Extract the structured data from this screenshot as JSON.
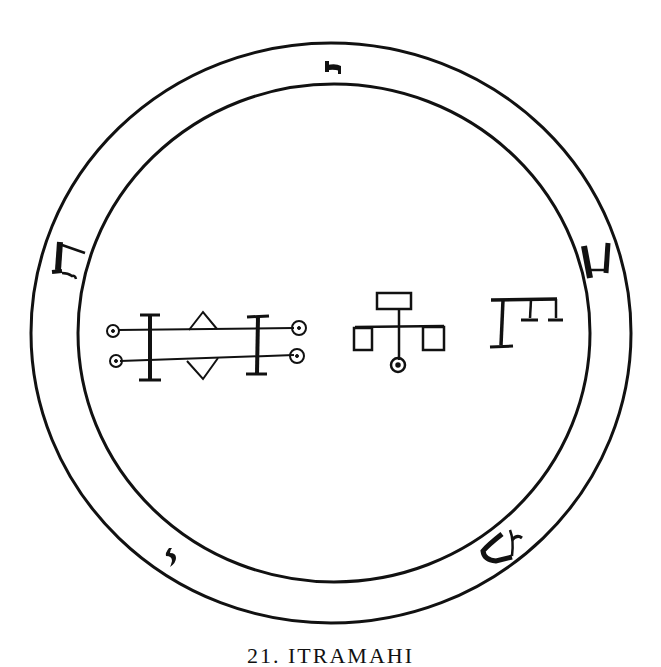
{
  "figure": {
    "type": "seal",
    "ink_color": "#111111",
    "background": "#ffffff",
    "outer_circle": {
      "cx": 331,
      "cy": 333,
      "rx": 300,
      "ry": 290
    },
    "inner_circle": {
      "cx": 334,
      "cy": 333,
      "rx": 256,
      "ry": 249
    },
    "ring_glyphs": [
      {
        "position": "top",
        "char": "ה"
      },
      {
        "position": "left",
        "char": "ח"
      },
      {
        "position": "right",
        "char": "ב"
      },
      {
        "position": "bottom-right",
        "char": "ש"
      },
      {
        "position": "bottom-left",
        "char": "י"
      }
    ],
    "central_sigils": [
      {
        "name": "double-bar-sigil"
      },
      {
        "name": "branch-sigil"
      },
      {
        "name": "comb-sigil"
      }
    ]
  },
  "caption": {
    "text": "21. ITRAMAHI",
    "truncated": true
  }
}
